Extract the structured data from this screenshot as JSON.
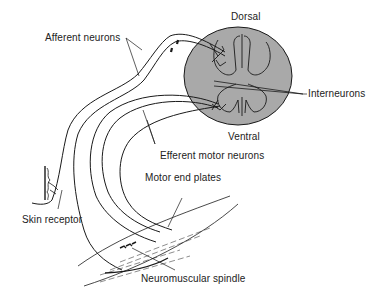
{
  "diagram": {
    "labels": {
      "dorsal": "Dorsal",
      "ventral": "Ventral",
      "interneurons": "Interneurons",
      "afferent": "Afferent neurons",
      "efferent": "Efferent motor neurons",
      "motor_end_plates": "Motor end plates",
      "skin_receptor": "Skin receptor",
      "spindle": "Neuromuscular spindle"
    },
    "colors": {
      "cord_fill": "#a9a9a9",
      "stroke": "#1a1a1a",
      "background": "#ffffff"
    }
  }
}
